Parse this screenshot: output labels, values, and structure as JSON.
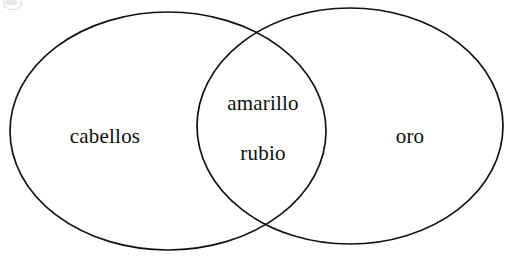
{
  "figure": {
    "kind": "venn-diagram",
    "set_count": 2,
    "background_color": "#ffffff",
    "outline_color": "#111111",
    "text_color": "#0d0d0d"
  },
  "sets": {
    "left": {
      "label": "cabellos",
      "center_x": 168,
      "center_y": 131,
      "radius_x": 158,
      "radius_y": 119
    },
    "right": {
      "label": "oro",
      "center_x": 350,
      "center_y": 126,
      "radius_x": 153,
      "radius_y": 118
    }
  },
  "intersection": {
    "labels": [
      "amarillo",
      "rubio"
    ],
    "label_top": "amarillo",
    "label_bottom": "rubio"
  },
  "artifacts": {
    "corner_mark": "scan-artifact"
  }
}
